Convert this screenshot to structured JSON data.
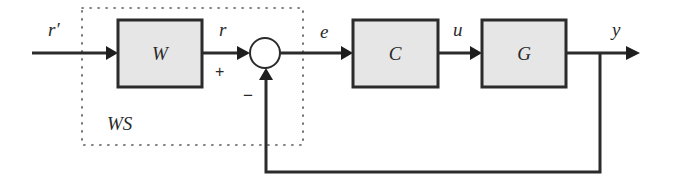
{
  "diagram": {
    "type": "feedback-control-block-diagram",
    "blocks": [
      {
        "id": "W",
        "label": "W"
      },
      {
        "id": "C",
        "label": "C"
      },
      {
        "id": "G",
        "label": "G"
      }
    ],
    "group": {
      "label": "WS"
    },
    "summing_junction": {
      "plus_sign": "+",
      "minus_sign": "−"
    },
    "signals": {
      "r_prime": "r′",
      "r": "r",
      "e": "e",
      "u": "u",
      "y": "y"
    }
  }
}
